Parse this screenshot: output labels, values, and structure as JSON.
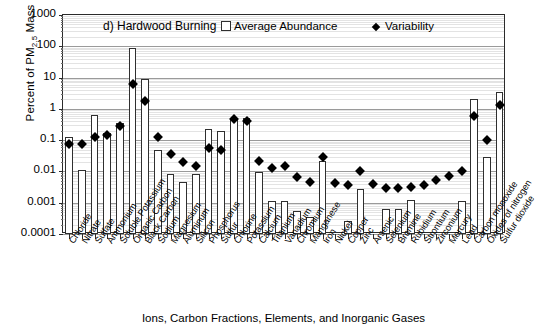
{
  "axes": {
    "y_title_pre": "Percent of PM",
    "y_title_sub": "2.5",
    "y_title_post": " Mass",
    "x_title": "Ions, Carbon Fractions, Elements, and Inorganic Gases",
    "y_ticks": [
      "1000",
      "100",
      "10",
      "1",
      "0.1",
      "0.01",
      "0.001",
      "0.0001"
    ]
  },
  "legend": {
    "series1": "Average Abundance",
    "series2": "Variability"
  },
  "panel_label": "d) Hardwood Burning",
  "chart_data": {
    "type": "bar",
    "title": "d) Hardwood Burning",
    "xlabel": "Ions, Carbon Fractions, Elements, and Inorganic Gases",
    "ylabel": "Percent of PM2.5 Mass",
    "yscale": "log",
    "ylim": [
      0.0001,
      1000
    ],
    "grid": true,
    "legend_position": "top-inside",
    "categories": [
      "Chloride",
      "Nitrate",
      "Sulfate",
      "Ammonium",
      "Soluble Potassium",
      "Organic Carbon",
      "Black Carbon",
      "Sodium",
      "Magnesium",
      "Aluminum",
      "Silicon",
      "Phosphorus",
      "Sulfur",
      "Chlorine",
      "Potassium",
      "Calcium",
      "Titanium",
      "Vanadium",
      "Chromium",
      "Manganese",
      "Iron",
      "Nickel",
      "Copper",
      "Zinc",
      "Arsenic",
      "Selenium",
      "Bromine",
      "Rubidium",
      "Strontium",
      "Zirconium",
      "Mercury",
      "Lead",
      "Carbon monoxide",
      "Oxides of nitrogen",
      "Sulfur dioxide"
    ],
    "series": [
      {
        "name": "Average Abundance",
        "type": "bar",
        "values": [
          0.13,
          0.011,
          0.65,
          0.17,
          0.36,
          88,
          8.8,
          0.05,
          0.0086,
          0.0046,
          0.0082,
          0.23,
          0.19,
          0.5,
          0.53,
          0.0096,
          0.0011,
          0.0011,
          0.00055,
          0.00035,
          0.0215,
          null,
          0.00026,
          0.0028,
          null,
          0.00062,
          0.00065,
          0.0012,
          null,
          null,
          null,
          0.0011,
          2.1,
          0.028,
          3.6
        ]
      },
      {
        "name": "Variability",
        "type": "scatter",
        "values": [
          0.073,
          0.074,
          0.122,
          0.143,
          0.29,
          6.2,
          1.75,
          0.13,
          0.035,
          0.0205,
          0.015,
          0.056,
          0.049,
          0.47,
          0.42,
          0.022,
          0.0125,
          0.0155,
          0.0068,
          0.0046,
          0.029,
          0.0042,
          0.0038,
          0.0105,
          0.0039,
          0.0029,
          0.0029,
          0.0031,
          0.0036,
          0.0055,
          0.0073,
          0.0105,
          0.6,
          0.105,
          1.35
        ]
      }
    ]
  }
}
